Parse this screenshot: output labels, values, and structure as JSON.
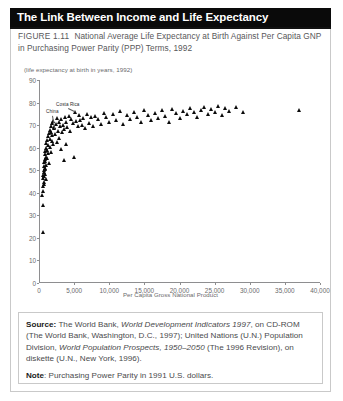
{
  "header": {
    "title": "The Link Between Income and Life Expectancy"
  },
  "caption": {
    "figure_number": "FIGURE 1.11",
    "text": "National Average Life Expectancy at Birth Against Per Capita GNP in Purchasing Power Parity (PPP) Terms, 1992"
  },
  "notes": {
    "source_label": "Source:",
    "source_part1": " The World Bank, ",
    "source_italic1": "World Development Indicators 1997",
    "source_part2": ", on CD-ROM (The World Bank, Washington, D.C., 1997); United Nations (U.N.) Population Division, ",
    "source_italic2": "World Population Prospects, 1950–2050",
    "source_part3": " (The 1996 Revision), on diskette (U.N., New York, 1996).",
    "note_label": "Note",
    "note_text": ": Purchasing Power Parity in 1991 U.S. dollars."
  },
  "chart_data": {
    "type": "scatter",
    "title": "National Average Life Expectancy at Birth Against Per Capita GNP in Purchasing Power Parity (PPP) Terms, 1992",
    "xlabel": "Per Capita Gross National Product",
    "ylabel": "(life expectancy at birth in years, 1992)",
    "xlim": [
      0,
      40000
    ],
    "ylim": [
      0,
      90
    ],
    "xticks": [
      0,
      5000,
      10000,
      15000,
      20000,
      25000,
      30000,
      35000,
      40000
    ],
    "xticklabels": [
      "0",
      "5,000",
      "10,000",
      "15,000",
      "20,000",
      "25,000",
      "30,000",
      "35,000",
      "40,000"
    ],
    "yticks": [
      0,
      10,
      20,
      30,
      40,
      50,
      60,
      70,
      80,
      90
    ],
    "yticklabels": [
      "0",
      "10",
      "20",
      "30",
      "40",
      "50",
      "60",
      "70",
      "80",
      "90"
    ],
    "grid": false,
    "legend": false,
    "marker": "triangle",
    "marker_color": "#0b0b0b",
    "annotations": [
      {
        "label": "China",
        "x": 1900,
        "y": 74.5,
        "point_x": 2200,
        "point_y": 69.0
      },
      {
        "label": "Costa Rica",
        "x": 4100,
        "y": 77.5,
        "point_x": 5100,
        "point_y": 76.0
      }
    ],
    "points": [
      [
        450,
        39.0
      ],
      [
        500,
        22.5
      ],
      [
        520,
        34.5
      ],
      [
        560,
        41.0
      ],
      [
        600,
        43.0
      ],
      [
        620,
        46.5
      ],
      [
        640,
        48.0
      ],
      [
        660,
        45.0
      ],
      [
        680,
        50.0
      ],
      [
        700,
        47.5
      ],
      [
        720,
        52.0
      ],
      [
        740,
        49.0
      ],
      [
        760,
        44.0
      ],
      [
        780,
        53.5
      ],
      [
        800,
        51.0
      ],
      [
        820,
        55.0
      ],
      [
        840,
        48.5
      ],
      [
        860,
        57.0
      ],
      [
        880,
        54.0
      ],
      [
        900,
        50.5
      ],
      [
        920,
        58.5
      ],
      [
        940,
        46.0
      ],
      [
        960,
        60.0
      ],
      [
        980,
        56.0
      ],
      [
        1000,
        52.5
      ],
      [
        1050,
        62.0
      ],
      [
        1100,
        59.0
      ],
      [
        1150,
        55.5
      ],
      [
        1200,
        63.5
      ],
      [
        1250,
        61.0
      ],
      [
        1300,
        57.5
      ],
      [
        1350,
        65.0
      ],
      [
        1400,
        53.0
      ],
      [
        1450,
        66.5
      ],
      [
        1500,
        64.0
      ],
      [
        1550,
        60.5
      ],
      [
        1600,
        68.0
      ],
      [
        1650,
        58.0
      ],
      [
        1700,
        69.5
      ],
      [
        1750,
        67.0
      ],
      [
        1800,
        63.0
      ],
      [
        1850,
        71.0
      ],
      [
        1900,
        65.5
      ],
      [
        1950,
        61.5
      ],
      [
        2000,
        72.0
      ],
      [
        2100,
        68.5
      ],
      [
        2200,
        69.0
      ],
      [
        2300,
        66.0
      ],
      [
        2400,
        70.5
      ],
      [
        2500,
        62.5
      ],
      [
        2600,
        73.0
      ],
      [
        2700,
        67.5
      ],
      [
        2800,
        71.5
      ],
      [
        2900,
        64.5
      ],
      [
        3000,
        69.8
      ],
      [
        3100,
        59.5
      ],
      [
        3200,
        72.5
      ],
      [
        3300,
        66.8
      ],
      [
        3400,
        70.0
      ],
      [
        3500,
        54.5
      ],
      [
        3600,
        68.2
      ],
      [
        3700,
        73.5
      ],
      [
        3800,
        71.2
      ],
      [
        3900,
        61.8
      ],
      [
        4000,
        69.2
      ],
      [
        4200,
        74.0
      ],
      [
        4400,
        67.2
      ],
      [
        4600,
        72.8
      ],
      [
        4800,
        70.8
      ],
      [
        5000,
        56.0
      ],
      [
        5100,
        76.0
      ],
      [
        5300,
        71.8
      ],
      [
        5500,
        69.6
      ],
      [
        5700,
        74.5
      ],
      [
        5900,
        72.2
      ],
      [
        6100,
        70.2
      ],
      [
        6300,
        73.2
      ],
      [
        6500,
        68.8
      ],
      [
        6800,
        75.0
      ],
      [
        7100,
        71.0
      ],
      [
        7400,
        73.8
      ],
      [
        7700,
        69.4
      ],
      [
        8000,
        74.2
      ],
      [
        8400,
        72.6
      ],
      [
        8800,
        70.6
      ],
      [
        9200,
        75.5
      ],
      [
        9600,
        73.4
      ],
      [
        10000,
        71.4
      ],
      [
        10500,
        74.8
      ],
      [
        11000,
        72.4
      ],
      [
        11500,
        76.2
      ],
      [
        12000,
        70.4
      ],
      [
        12500,
        74.6
      ],
      [
        13000,
        72.8
      ],
      [
        13500,
        75.8
      ],
      [
        14000,
        73.6
      ],
      [
        14500,
        71.6
      ],
      [
        15000,
        76.5
      ],
      [
        15500,
        74.4
      ],
      [
        16000,
        72.2
      ],
      [
        16500,
        75.2
      ],
      [
        17000,
        73.0
      ],
      [
        17500,
        76.8
      ],
      [
        18000,
        74.0
      ],
      [
        18500,
        71.2
      ],
      [
        19000,
        77.0
      ],
      [
        19500,
        75.4
      ],
      [
        20000,
        73.2
      ],
      [
        20500,
        76.4
      ],
      [
        21000,
        74.8
      ],
      [
        21500,
        77.4
      ],
      [
        22000,
        75.6
      ],
      [
        22500,
        73.4
      ],
      [
        23000,
        76.6
      ],
      [
        23500,
        78.0
      ],
      [
        24000,
        75.0
      ],
      [
        24500,
        77.2
      ],
      [
        25000,
        76.0
      ],
      [
        25500,
        78.4
      ],
      [
        26000,
        74.6
      ],
      [
        26500,
        77.6
      ],
      [
        27000,
        76.2
      ],
      [
        28000,
        78.2
      ],
      [
        29000,
        75.8
      ],
      [
        37000,
        76.5
      ]
    ]
  }
}
